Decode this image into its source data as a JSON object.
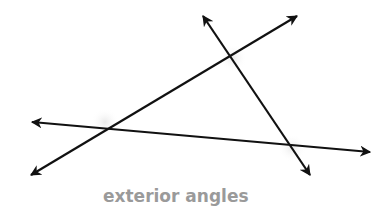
{
  "diagram": {
    "title": "exterior angles",
    "caption": "exterior angles",
    "line_color": "#111111",
    "caption_color": "#9a9a9a",
    "lines": [
      {
        "name": "line-a",
        "description": "rising line from bottom-left to top-right",
        "start": [
          31,
          175
        ],
        "end": [
          297,
          16
        ],
        "arrows": "both"
      },
      {
        "name": "line-b",
        "description": "nearly horizontal line sloping slightly downward",
        "start": [
          32,
          122
        ],
        "end": [
          370,
          152
        ],
        "arrows": "both"
      },
      {
        "name": "line-c",
        "description": "steep line from top to bottom-right",
        "start": [
          203,
          16
        ],
        "end": [
          310,
          175
        ],
        "arrows": "both"
      }
    ],
    "intersections": [
      {
        "name": "vertex-top",
        "point": [
          230,
          56
        ]
      },
      {
        "name": "vertex-left",
        "point": [
          108,
          128
        ]
      },
      {
        "name": "vertex-right",
        "point": [
          290,
          145
        ]
      }
    ]
  }
}
